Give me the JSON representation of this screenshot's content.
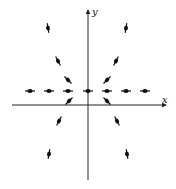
{
  "diagram": {
    "type": "direction-field",
    "axes": {
      "x_label": "x",
      "y_label": "y",
      "origin": [
        88,
        105
      ],
      "x_axis": {
        "x1": 12,
        "x2": 166
      },
      "y_axis": {
        "y1": 180,
        "y2": 10
      }
    },
    "colors": {
      "axis": "#222222",
      "segment": "#111111",
      "background": "#ffffff"
    },
    "segments": [
      {
        "cx": 30,
        "cy": 91,
        "angle": 0
      },
      {
        "cx": 49,
        "cy": 91,
        "angle": 0
      },
      {
        "cx": 68,
        "cy": 91,
        "angle": 0
      },
      {
        "cx": 88,
        "cy": 91,
        "angle": 0
      },
      {
        "cx": 107,
        "cy": 91,
        "angle": 0
      },
      {
        "cx": 126,
        "cy": 91,
        "angle": 0
      },
      {
        "cx": 145,
        "cy": 91,
        "angle": 0
      },
      {
        "cx": 68,
        "cy": 80,
        "angle": 45
      },
      {
        "cx": 107,
        "cy": 80,
        "angle": -45
      },
      {
        "cx": 58,
        "cy": 61,
        "angle": 62
      },
      {
        "cx": 116,
        "cy": 61,
        "angle": -62
      },
      {
        "cx": 48,
        "cy": 28,
        "angle": 80
      },
      {
        "cx": 126,
        "cy": 28,
        "angle": -80
      },
      {
        "cx": 69,
        "cy": 101,
        "angle": -45
      },
      {
        "cx": 107,
        "cy": 101,
        "angle": 45
      },
      {
        "cx": 59,
        "cy": 121,
        "angle": -62
      },
      {
        "cx": 117,
        "cy": 121,
        "angle": 62
      },
      {
        "cx": 49,
        "cy": 154,
        "angle": -80
      },
      {
        "cx": 127,
        "cy": 154,
        "angle": 80
      }
    ]
  }
}
